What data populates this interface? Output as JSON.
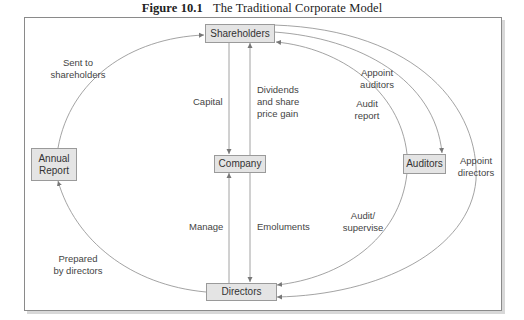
{
  "figure": {
    "number": "Figure 10.1",
    "title": "The Traditional Corporate Model"
  },
  "nodes": {
    "shareholders": "Shareholders",
    "company": "Company",
    "directors": "Directors",
    "auditors": "Auditors",
    "annual_report_line1": "Annual",
    "annual_report_line2": "Report"
  },
  "edges": {
    "sent_to_shareholders_1": "Sent to",
    "sent_to_shareholders_2": "shareholders",
    "capital": "Capital",
    "dividends_1": "Dividends",
    "dividends_2": "and share",
    "dividends_3": "price gain",
    "appoint_auditors_1": "Appoint",
    "appoint_auditors_2": "auditors",
    "audit_report_1": "Audit",
    "audit_report_2": "report",
    "appoint_directors_1": "Appoint",
    "appoint_directors_2": "directors",
    "manage": "Manage",
    "emoluments": "Emoluments",
    "audit_supervise_1": "Audit/",
    "audit_supervise_2": "supervise",
    "prepared_by_directors_1": "Prepared",
    "prepared_by_directors_2": "by directors"
  },
  "colors": {
    "box_fill": "#e4e4e4",
    "box_border": "#9a9a9a",
    "line": "#8c8c8c",
    "text": "#333333"
  }
}
